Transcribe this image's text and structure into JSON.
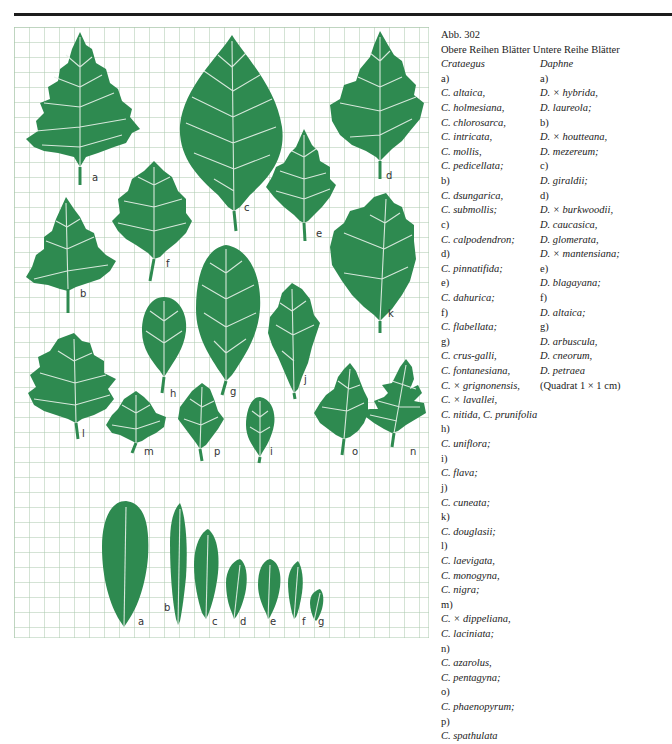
{
  "figure": {
    "number": "Abb. 302",
    "grid": {
      "cell_px": 15,
      "cols": 27,
      "rows": 40,
      "line_color": "#a9c8ac",
      "scale_note": "(Quadrat 1 × 1 cm)"
    },
    "leaf_color": "#2e8a50",
    "upper_labels": [
      "a",
      "b",
      "c",
      "d",
      "e",
      "f",
      "g",
      "h",
      "i",
      "j",
      "k",
      "l",
      "m",
      "n",
      "o",
      "p"
    ],
    "lower_labels": [
      "a",
      "b",
      "c",
      "d",
      "e",
      "f",
      "g"
    ]
  },
  "caption": {
    "title": "Abb. 302",
    "header_left": "Obere Reihen Blätter",
    "header_right": "Untere Reihe Blätter",
    "left_column": [
      {
        "text": "Crataegus",
        "kind": "genus"
      },
      {
        "text": "a)",
        "kind": "group"
      },
      {
        "text": "C. altaica,",
        "kind": "species"
      },
      {
        "text": "C. holmesiana,",
        "kind": "species"
      },
      {
        "text": "C. chlorosarca,",
        "kind": "species"
      },
      {
        "text": "C. intricata,",
        "kind": "species"
      },
      {
        "text": "C. mollis,",
        "kind": "species"
      },
      {
        "text": "C. pedicellata;",
        "kind": "species"
      },
      {
        "text": "b)",
        "kind": "group"
      },
      {
        "text": "C. dsungarica,",
        "kind": "species"
      },
      {
        "text": "C. submollis;",
        "kind": "species"
      },
      {
        "text": "c)",
        "kind": "group"
      },
      {
        "text": "C. calpodendron;",
        "kind": "species"
      },
      {
        "text": "d)",
        "kind": "group"
      },
      {
        "text": "C. pinnatifida;",
        "kind": "species"
      },
      {
        "text": "e)",
        "kind": "group"
      },
      {
        "text": "C. dahurica;",
        "kind": "species"
      },
      {
        "text": "f)",
        "kind": "group"
      },
      {
        "text": "C. flabellata;",
        "kind": "species"
      },
      {
        "text": "g)",
        "kind": "group"
      },
      {
        "text": "C. crus-galli,",
        "kind": "species"
      },
      {
        "text": "C. fontanesiana,",
        "kind": "species"
      },
      {
        "text": "C. × grignonensis,",
        "kind": "species"
      },
      {
        "text": "C. × lavallei,",
        "kind": "species"
      },
      {
        "text": "C. nitida, C. prunifolia",
        "kind": "species"
      },
      {
        "text": "h)",
        "kind": "group"
      },
      {
        "text": "C. uniflora;",
        "kind": "species"
      },
      {
        "text": "i)",
        "kind": "group"
      },
      {
        "text": "C. flava;",
        "kind": "species"
      },
      {
        "text": "j)",
        "kind": "group"
      },
      {
        "text": "C. cuneata;",
        "kind": "species"
      },
      {
        "text": "k)",
        "kind": "group"
      },
      {
        "text": "C. douglasii;",
        "kind": "species"
      },
      {
        "text": "l)",
        "kind": "group"
      },
      {
        "text": "C. laevigata,",
        "kind": "species"
      },
      {
        "text": "C. monogyna,",
        "kind": "species"
      },
      {
        "text": "C. nigra;",
        "kind": "species"
      },
      {
        "text": "m)",
        "kind": "group"
      },
      {
        "text": "C. × dippeliana,",
        "kind": "species"
      },
      {
        "text": "C. laciniata;",
        "kind": "species"
      },
      {
        "text": "n)",
        "kind": "group"
      },
      {
        "text": "C. azarolus,",
        "kind": "species"
      },
      {
        "text": "C. pentagyna;",
        "kind": "species"
      },
      {
        "text": "o)",
        "kind": "group"
      },
      {
        "text": "C. phaenopyrum;",
        "kind": "species"
      },
      {
        "text": "p)",
        "kind": "group"
      },
      {
        "text": "C. spathulata",
        "kind": "species"
      }
    ],
    "right_column": [
      {
        "text": "Daphne",
        "kind": "genus"
      },
      {
        "text": "a)",
        "kind": "group"
      },
      {
        "text": "D. × hybrida,",
        "kind": "species"
      },
      {
        "text": "D. laureola;",
        "kind": "species"
      },
      {
        "text": "b)",
        "kind": "group"
      },
      {
        "text": "D. × houtteana,",
        "kind": "species"
      },
      {
        "text": "D. mezereum;",
        "kind": "species"
      },
      {
        "text": "c)",
        "kind": "group"
      },
      {
        "text": "D. giraldii;",
        "kind": "species"
      },
      {
        "text": "d)",
        "kind": "group"
      },
      {
        "text": "D. × burkwoodii,",
        "kind": "species"
      },
      {
        "text": "D. caucasica,",
        "kind": "species"
      },
      {
        "text": "D. glomerata,",
        "kind": "species"
      },
      {
        "text": "D. × mantensiana;",
        "kind": "species"
      },
      {
        "text": "e)",
        "kind": "group"
      },
      {
        "text": "D. blagayana;",
        "kind": "species"
      },
      {
        "text": "f)",
        "kind": "group"
      },
      {
        "text": "D. altaica;",
        "kind": "species"
      },
      {
        "text": "g)",
        "kind": "group"
      },
      {
        "text": "D. arbuscula,",
        "kind": "species"
      },
      {
        "text": "D. cneorum,",
        "kind": "species"
      },
      {
        "text": "D. petraea",
        "kind": "species"
      },
      {
        "text": "(Quadrat 1 × 1 cm)",
        "kind": "note"
      }
    ]
  }
}
